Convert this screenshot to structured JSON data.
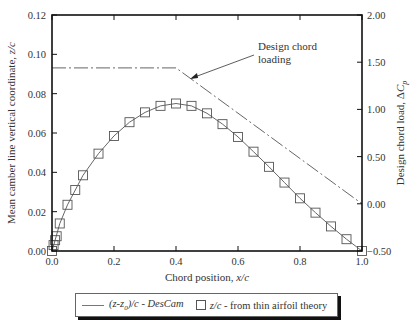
{
  "chart_data": {
    "type": "line",
    "title": "",
    "xlabel": "Chord position, x/c",
    "ylabel": "Mean camber line vertical coordinate, z/c",
    "y2label": "Design chord load, ΔC_p",
    "xlim": [
      0.0,
      1.0
    ],
    "ylim": [
      0.0,
      0.12
    ],
    "y2lim": [
      -0.5,
      2.0
    ],
    "grid": false,
    "legend_position": "bottom",
    "x_ticks": [
      "0.0",
      "0.2",
      "0.4",
      "0.6",
      "0.8",
      "1.0"
    ],
    "y_ticks": [
      "0.00",
      "0.02",
      "0.04",
      "0.06",
      "0.08",
      "0.10",
      "0.12"
    ],
    "y2_ticks": [
      "-0.50",
      "0.00",
      "0.50",
      "1.00",
      "1.50",
      "2.00"
    ],
    "series": [
      {
        "name": "(z-z0)/c - DesCam",
        "style": "solid-line",
        "axis": "left",
        "x": [
          0.0,
          0.01,
          0.025,
          0.05,
          0.075,
          0.1,
          0.15,
          0.2,
          0.25,
          0.3,
          0.35,
          0.4,
          0.45,
          0.5,
          0.55,
          0.6,
          0.65,
          0.7,
          0.75,
          0.8,
          0.85,
          0.9,
          0.95,
          1.0
        ],
        "y": [
          0.0,
          0.0055,
          0.014,
          0.0235,
          0.031,
          0.0385,
          0.0495,
          0.0585,
          0.0655,
          0.0705,
          0.0738,
          0.075,
          0.0738,
          0.07,
          0.0645,
          0.058,
          0.0505,
          0.0428,
          0.0348,
          0.0268,
          0.0195,
          0.0125,
          0.006,
          0.0
        ]
      },
      {
        "name": "z/c - from thin airfoil theory",
        "style": "square-markers",
        "axis": "left",
        "x": [
          0.0,
          0.005,
          0.01,
          0.015,
          0.025,
          0.05,
          0.075,
          0.1,
          0.15,
          0.2,
          0.25,
          0.3,
          0.35,
          0.4,
          0.45,
          0.5,
          0.55,
          0.6,
          0.65,
          0.7,
          0.75,
          0.8,
          0.85,
          0.9,
          0.95,
          1.0
        ],
        "y": [
          0.0,
          0.003,
          0.0055,
          0.0075,
          0.014,
          0.0235,
          0.031,
          0.0385,
          0.0495,
          0.0585,
          0.0655,
          0.0705,
          0.0738,
          0.075,
          0.0738,
          0.07,
          0.0645,
          0.058,
          0.0505,
          0.0428,
          0.0348,
          0.0268,
          0.0195,
          0.0125,
          0.006,
          0.0
        ]
      },
      {
        "name": "Design chord loading",
        "style": "dash-dot-line",
        "axis": "right",
        "x": [
          0.0,
          0.4,
          1.0
        ],
        "y": [
          1.44,
          1.44,
          0.0
        ]
      }
    ],
    "annotations": [
      {
        "text": "Design chord loading",
        "arrow_to": [
          0.43,
          1.33
        ]
      }
    ]
  },
  "annotation": {
    "line1": "Design chord",
    "line2": "loading"
  },
  "axes": {
    "xlabel_prefix": "Chord position, ",
    "xlabel_var": "x/c",
    "ylabel_prefix": "Mean camber line vertical coordinate, ",
    "ylabel_var": "z/c",
    "y2label_prefix": "Design chord load, Δ",
    "y2label_var": "C",
    "y2label_sub": "p"
  },
  "legend": {
    "item1_label_a": "(z-z",
    "item1_label_sub": "0",
    "item1_label_b": ")/c",
    "item1_sep": " - ",
    "item1_label_c": "DesCam",
    "item2_label_a": "z/c",
    "item2_label_b": " - from thin airfoil theory"
  },
  "colors": {
    "axis": "#111111",
    "line": "#555555",
    "marker": "#555555",
    "text": "#333333"
  }
}
